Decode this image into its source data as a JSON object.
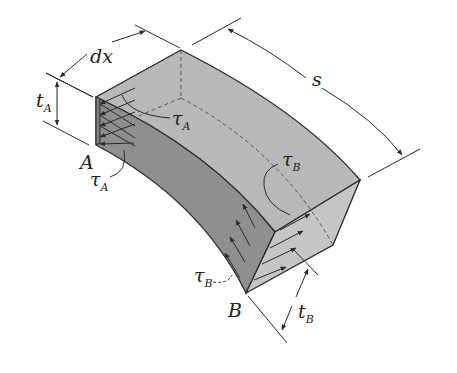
{
  "figure": {
    "labels": {
      "dx": "dx",
      "s": "s",
      "tA_main": "t",
      "tA_sub": "A",
      "tB_main": "t",
      "tB_sub": "B",
      "point_A": "A",
      "point_B": "B",
      "tauA1_main": "τ",
      "tauA1_sub": "A",
      "tauA2_main": "τ",
      "tauA2_sub": "A",
      "tauB1_main": "τ",
      "tauB1_sub": "B",
      "tauB2_main": "τ",
      "tauB2_sub": "B"
    },
    "colors": {
      "top_face": "#b9b9b9",
      "side_face": "#8f8f8f",
      "end_face": "#c6c6c6",
      "left_face": "#9a9a9a",
      "lines": "#2a2a2a"
    }
  }
}
